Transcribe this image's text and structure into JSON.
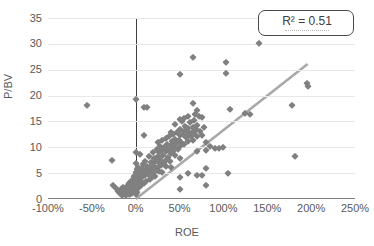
{
  "chart_data": {
    "type": "scatter",
    "title": "",
    "xlabel": "ROE",
    "ylabel": "P/BV",
    "xlim": [
      -100,
      250
    ],
    "ylim": [
      0,
      35
    ],
    "x_ticks": [
      "-100%",
      "-50%",
      "0%",
      "50%",
      "100%",
      "150%",
      "200%",
      "250%"
    ],
    "x_tick_values": [
      -100,
      -50,
      0,
      50,
      100,
      150,
      200,
      250
    ],
    "y_ticks": [
      "0",
      "5",
      "10",
      "15",
      "20",
      "25",
      "30",
      "35"
    ],
    "y_tick_values": [
      0,
      5,
      10,
      15,
      20,
      25,
      30,
      35
    ],
    "grid": true,
    "grid_axis": "y",
    "legend_position": "top-right",
    "annotations": [
      {
        "text": "R² = 0.51",
        "type": "r-squared-box"
      }
    ],
    "marker": {
      "shape": "diamond",
      "color": "#808080",
      "size": 4.6
    },
    "trendline": {
      "type": "linear",
      "color": "#a8a8a8",
      "width": 2.6,
      "x_start": 0,
      "y_start": 0,
      "x_end": 196,
      "y_end": 26.1,
      "r_squared": 0.51
    },
    "reference_lines": [
      {
        "orientation": "vertical",
        "value": 0,
        "color": "#3f3f3f"
      },
      {
        "orientation": "horizontal",
        "value": 0,
        "color": "#808080"
      }
    ],
    "points": [
      [
        -55,
        18.1
      ],
      [
        -27,
        7.6
      ],
      [
        -26,
        2.8
      ],
      [
        -22,
        2.2
      ],
      [
        -20,
        1.6
      ],
      [
        -18,
        1.1
      ],
      [
        -17,
        2.0
      ],
      [
        -16,
        0.8
      ],
      [
        -15,
        1.4
      ],
      [
        -14,
        2.4
      ],
      [
        -13,
        1.0
      ],
      [
        -12,
        1.8
      ],
      [
        -11,
        0.7
      ],
      [
        -10,
        2.6
      ],
      [
        -10,
        1.3
      ],
      [
        -9,
        2.0
      ],
      [
        -8,
        1.0
      ],
      [
        -8,
        3.0
      ],
      [
        -7,
        1.6
      ],
      [
        -7,
        2.3
      ],
      [
        -6,
        0.9
      ],
      [
        -6,
        2.8
      ],
      [
        -5,
        1.5
      ],
      [
        -5,
        3.4
      ],
      [
        -4,
        2.0
      ],
      [
        -4,
        1.1
      ],
      [
        -3,
        2.6
      ],
      [
        -3,
        3.8
      ],
      [
        -2,
        1.7
      ],
      [
        -2,
        4.4
      ],
      [
        -1,
        2.2
      ],
      [
        -1,
        3.1
      ],
      [
        0,
        19.4
      ],
      [
        0,
        9.1
      ],
      [
        0,
        6.9
      ],
      [
        0,
        5.2
      ],
      [
        0,
        4.0
      ],
      [
        0,
        3.1
      ],
      [
        0,
        2.4
      ],
      [
        0,
        1.6
      ],
      [
        0,
        0.9
      ],
      [
        1,
        5.8
      ],
      [
        1,
        3.5
      ],
      [
        1,
        2.1
      ],
      [
        2,
        4.6
      ],
      [
        2,
        2.8
      ],
      [
        2,
        1.4
      ],
      [
        3,
        6.2
      ],
      [
        3,
        3.2
      ],
      [
        4,
        4.8
      ],
      [
        4,
        2.4
      ],
      [
        5,
        8.7
      ],
      [
        5,
        5.4
      ],
      [
        5,
        3.6
      ],
      [
        6,
        4.2
      ],
      [
        6,
        2.7
      ],
      [
        7,
        5.9
      ],
      [
        7,
        3.3
      ],
      [
        8,
        6.7
      ],
      [
        8,
        4.4
      ],
      [
        9,
        5.1
      ],
      [
        9,
        3.0
      ],
      [
        10,
        12.4
      ],
      [
        10,
        17.8
      ],
      [
        11,
        7.3
      ],
      [
        11,
        4.7
      ],
      [
        12,
        5.6
      ],
      [
        12,
        3.4
      ],
      [
        13,
        17.7
      ],
      [
        13,
        6.4
      ],
      [
        14,
        4.9
      ],
      [
        15,
        8.4
      ],
      [
        15,
        5.3
      ],
      [
        16,
        6.0
      ],
      [
        16,
        3.9
      ],
      [
        17,
        7.1
      ],
      [
        18,
        5.6
      ],
      [
        18,
        4.2
      ],
      [
        19,
        6.5
      ],
      [
        20,
        9.1
      ],
      [
        20,
        7.0
      ],
      [
        20,
        5.0
      ],
      [
        21,
        8.0
      ],
      [
        22,
        6.1
      ],
      [
        22,
        4.5
      ],
      [
        23,
        7.4
      ],
      [
        24,
        9.6
      ],
      [
        24,
        5.7
      ],
      [
        25,
        11.0
      ],
      [
        25,
        8.3
      ],
      [
        25,
        6.2
      ],
      [
        26,
        7.2
      ],
      [
        27,
        9.0
      ],
      [
        27,
        5.4
      ],
      [
        28,
        10.3
      ],
      [
        28,
        7.8
      ],
      [
        29,
        6.5
      ],
      [
        30,
        11.5
      ],
      [
        30,
        9.4
      ],
      [
        30,
        7.1
      ],
      [
        30,
        5.2
      ],
      [
        31,
        8.6
      ],
      [
        32,
        10.0
      ],
      [
        32,
        6.8
      ],
      [
        33,
        9.9
      ],
      [
        34,
        7.6
      ],
      [
        35,
        11.8
      ],
      [
        35,
        9.2
      ],
      [
        35,
        6.4
      ],
      [
        36,
        10.7
      ],
      [
        37,
        8.1
      ],
      [
        38,
        12.1
      ],
      [
        38,
        9.6
      ],
      [
        39,
        7.3
      ],
      [
        40,
        13.0
      ],
      [
        40,
        10.5
      ],
      [
        40,
        8.8
      ],
      [
        40,
        6.2
      ],
      [
        41,
        11.2
      ],
      [
        42,
        9.3
      ],
      [
        43,
        12.6
      ],
      [
        44,
        10.1
      ],
      [
        45,
        14.5
      ],
      [
        45,
        11.6
      ],
      [
        45,
        8.5
      ],
      [
        46,
        10.8
      ],
      [
        47,
        12.9
      ],
      [
        48,
        9.7
      ],
      [
        49,
        11.4
      ],
      [
        50,
        24.2
      ],
      [
        50,
        15.4
      ],
      [
        50,
        12.3
      ],
      [
        50,
        10.2
      ],
      [
        50,
        8.0
      ],
      [
        50,
        4.3
      ],
      [
        50,
        2.0
      ],
      [
        51,
        13.6
      ],
      [
        52,
        11.0
      ],
      [
        53,
        15.0
      ],
      [
        54,
        12.5
      ],
      [
        55,
        15.6
      ],
      [
        55,
        13.1
      ],
      [
        55,
        10.6
      ],
      [
        56,
        14.2
      ],
      [
        57,
        11.9
      ],
      [
        58,
        13.4
      ],
      [
        59,
        12.0
      ],
      [
        60,
        16.0
      ],
      [
        60,
        13.8
      ],
      [
        60,
        11.3
      ],
      [
        60,
        5.0
      ],
      [
        61,
        12.7
      ],
      [
        62,
        14.8
      ],
      [
        63,
        12.2
      ],
      [
        64,
        13.0
      ],
      [
        65,
        27.4
      ],
      [
        65,
        18.6
      ],
      [
        65,
        14.0
      ],
      [
        65,
        11.5
      ],
      [
        66,
        15.2
      ],
      [
        67,
        12.8
      ],
      [
        68,
        16.4
      ],
      [
        69,
        13.5
      ],
      [
        70,
        17.2
      ],
      [
        70,
        14.4
      ],
      [
        70,
        12.1
      ],
      [
        70,
        9.2
      ],
      [
        70,
        4.7
      ],
      [
        72,
        16.0
      ],
      [
        73,
        13.2
      ],
      [
        75,
        15.8
      ],
      [
        75,
        12.4
      ],
      [
        75,
        4.6
      ],
      [
        78,
        14.0
      ],
      [
        80,
        11.0
      ],
      [
        80,
        9.4
      ],
      [
        80,
        6.0
      ],
      [
        80,
        2.8
      ],
      [
        85,
        10.2
      ],
      [
        90,
        9.9
      ],
      [
        95,
        9.9
      ],
      [
        100,
        10.0
      ],
      [
        103,
        26.4
      ],
      [
        103,
        24.3
      ],
      [
        105,
        5.0
      ],
      [
        108,
        17.4
      ],
      [
        125,
        16.6
      ],
      [
        130,
        16.5
      ],
      [
        140,
        30.2
      ],
      [
        178,
        18.2
      ],
      [
        182,
        8.4
      ],
      [
        195,
        22.5
      ],
      [
        196,
        21.8
      ]
    ]
  }
}
